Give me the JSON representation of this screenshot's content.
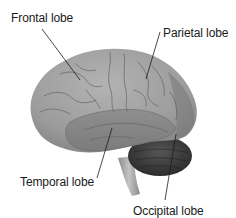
{
  "diagram": {
    "labels": [
      {
        "id": "frontal",
        "text": "Frontal lobe"
      },
      {
        "id": "parietal",
        "text": "Parietal lobe"
      },
      {
        "id": "temporal",
        "text": "Temporal lobe"
      },
      {
        "id": "occipital",
        "text": "Occipital lobe"
      }
    ],
    "colors": {
      "background": "#ffffff",
      "cerebrum": "#9a9a9a",
      "cerebrum_highlight": "#b0b0b0",
      "temporal": "#8c8c8c",
      "cerebellum": "#3e3e3e",
      "brainstem": "#a8a8a8",
      "sulci": "#6e6e6e",
      "leader_line": "#1a1a1a",
      "label_text": "#1a1a1a"
    }
  }
}
